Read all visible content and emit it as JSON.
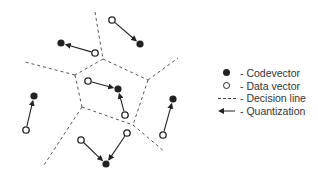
{
  "diagram": {
    "colors": {
      "ink": "#222222",
      "line": "#555555",
      "text": "#333333",
      "background": "#ffffff"
    },
    "decision_lines": [
      {
        "x1": 95,
        "y1": 12,
        "x2": 103,
        "y2": 59
      },
      {
        "x1": 103,
        "y1": 59,
        "x2": 75,
        "y2": 75
      },
      {
        "x1": 75,
        "y1": 75,
        "x2": 25,
        "y2": 62
      },
      {
        "x1": 103,
        "y1": 59,
        "x2": 148,
        "y2": 80
      },
      {
        "x1": 148,
        "y1": 80,
        "x2": 178,
        "y2": 58
      },
      {
        "x1": 75,
        "y1": 75,
        "x2": 82,
        "y2": 107
      },
      {
        "x1": 82,
        "y1": 107,
        "x2": 133,
        "y2": 125
      },
      {
        "x1": 148,
        "y1": 80,
        "x2": 133,
        "y2": 125
      },
      {
        "x1": 133,
        "y1": 125,
        "x2": 165,
        "y2": 152
      },
      {
        "x1": 82,
        "y1": 107,
        "x2": 44,
        "y2": 165
      }
    ],
    "codevectors": [
      {
        "x": 61,
        "y": 43
      },
      {
        "x": 140,
        "y": 44
      },
      {
        "x": 118,
        "y": 89
      },
      {
        "x": 34,
        "y": 96
      },
      {
        "x": 173,
        "y": 99
      },
      {
        "x": 106,
        "y": 164
      }
    ],
    "data_vectors": [
      {
        "x": 112,
        "y": 20
      },
      {
        "x": 95,
        "y": 53
      },
      {
        "x": 88,
        "y": 81
      },
      {
        "x": 125,
        "y": 115
      },
      {
        "x": 26,
        "y": 130
      },
      {
        "x": 81,
        "y": 140
      },
      {
        "x": 127,
        "y": 133
      },
      {
        "x": 163,
        "y": 135
      }
    ],
    "quantization_arrows": [
      {
        "x1": 112,
        "y1": 20,
        "x2": 140,
        "y2": 44
      },
      {
        "x1": 95,
        "y1": 53,
        "x2": 61,
        "y2": 43
      },
      {
        "x1": 88,
        "y1": 81,
        "x2": 118,
        "y2": 89
      },
      {
        "x1": 125,
        "y1": 115,
        "x2": 118,
        "y2": 89
      },
      {
        "x1": 26,
        "y1": 130,
        "x2": 34,
        "y2": 96
      },
      {
        "x1": 81,
        "y1": 140,
        "x2": 106,
        "y2": 164
      },
      {
        "x1": 127,
        "y1": 133,
        "x2": 106,
        "y2": 164
      },
      {
        "x1": 163,
        "y1": 135,
        "x2": 173,
        "y2": 99
      }
    ]
  },
  "legend": {
    "items": [
      {
        "symbol": "filled-circle",
        "label": "- Codevector"
      },
      {
        "symbol": "open-circle",
        "label": "- Data vector"
      },
      {
        "symbol": "dashed-line",
        "label": "- Decision line"
      },
      {
        "symbol": "arrow",
        "label": "- Quantization"
      }
    ]
  }
}
